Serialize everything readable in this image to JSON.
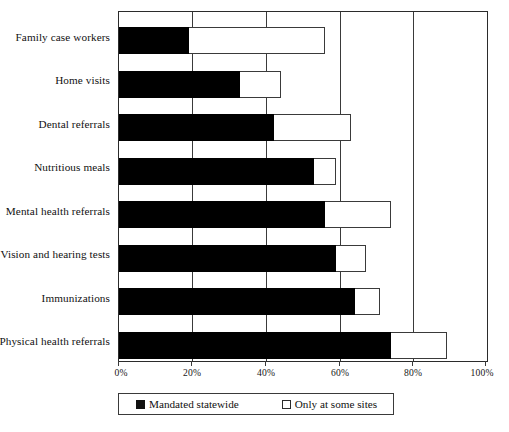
{
  "chart_data": {
    "type": "bar",
    "orientation": "horizontal",
    "stacked": true,
    "title": "",
    "subtitle": "",
    "xlabel": "",
    "ylabel": "",
    "xlim": [
      0,
      100
    ],
    "grid": true,
    "legend_position": "bottom",
    "categories": [
      "Family case workers",
      "Home visits",
      "Dental referrals",
      "Nutritious meals",
      "Mental health referrals",
      "Vision and hearing tests",
      "Immunizations",
      "Physical health referrals"
    ],
    "tick_labels": [
      "0%",
      "20%",
      "40%",
      "60%",
      "80%",
      "100%"
    ],
    "tick_values": [
      0,
      20,
      40,
      60,
      80,
      100
    ],
    "series": [
      {
        "name": "Mandated statewide",
        "color": "#000000",
        "swatch": "filled",
        "values": [
          19,
          33,
          42,
          53,
          56,
          59,
          64,
          74
        ]
      },
      {
        "name": "Only at some sites",
        "color": "#ffffff",
        "swatch": "open",
        "values": [
          37,
          11,
          21,
          6,
          18,
          8,
          7,
          15
        ]
      }
    ],
    "totals": [
      56,
      44,
      63,
      59,
      74,
      67,
      71,
      89
    ]
  }
}
